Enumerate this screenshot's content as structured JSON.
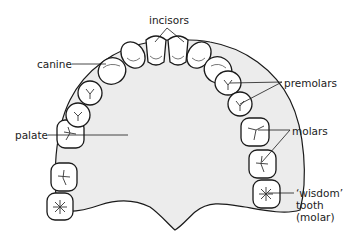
{
  "diagram": {
    "colors": {
      "palate_fill": "#ececec",
      "outline": "#1a1a1a",
      "tooth_fill": "#ffffff",
      "label_text": "#222222"
    },
    "labels": {
      "incisors": "incisors",
      "canine": "canine",
      "premolars": "premolars",
      "palate": "palate",
      "molars": "molars",
      "wisdom_line1": "‘wisdom’",
      "wisdom_line2": "tooth",
      "wisdom_line3": "(molar)"
    },
    "teeth": [
      {
        "type": "molar",
        "side": "left",
        "note": "wisdom"
      },
      {
        "type": "molar",
        "side": "left"
      },
      {
        "type": "molar",
        "side": "left"
      },
      {
        "type": "premolar",
        "side": "left"
      },
      {
        "type": "premolar",
        "side": "left"
      },
      {
        "type": "canine",
        "side": "left"
      },
      {
        "type": "incisor",
        "side": "left"
      },
      {
        "type": "incisor",
        "side": "left"
      },
      {
        "type": "incisor",
        "side": "right"
      },
      {
        "type": "incisor",
        "side": "right"
      },
      {
        "type": "canine",
        "side": "right"
      },
      {
        "type": "premolar",
        "side": "right"
      },
      {
        "type": "premolar",
        "side": "right"
      },
      {
        "type": "molar",
        "side": "right"
      },
      {
        "type": "molar",
        "side": "right"
      },
      {
        "type": "molar",
        "side": "right",
        "note": "wisdom"
      }
    ]
  }
}
